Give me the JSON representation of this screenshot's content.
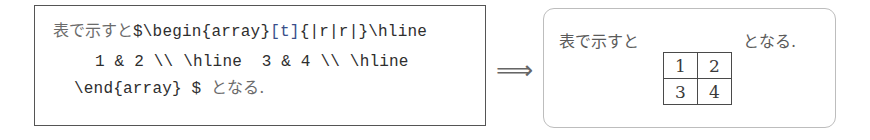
{
  "source": {
    "line1": {
      "jp_prefix": "表で示すと",
      "code_before_opt": "$\\begin{array}",
      "opt": "[t]",
      "code_after_opt": "{|r|r|}\\hline"
    },
    "line2": {
      "code": "1 & 2 \\\\ \\hline  3 & 4 \\\\ \\hline"
    },
    "line3": {
      "code": "\\end{array} $ ",
      "jp_suffix": "となる."
    }
  },
  "arrow": {
    "glyph": "⟹",
    "icon": "double-right-arrow-icon"
  },
  "result": {
    "prefix": "表で示すと",
    "suffix": "となる.",
    "table": {
      "rows": [
        [
          "1",
          "2"
        ],
        [
          "3",
          "4"
        ]
      ]
    }
  },
  "colors": {
    "option_highlight": "#3a4f8a",
    "source_border": "#555555",
    "result_border": "#bdbdbd"
  }
}
